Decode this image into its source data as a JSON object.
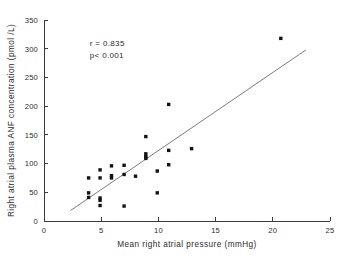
{
  "chart_data": {
    "type": "scatter",
    "title": "",
    "xlabel": "Mean right atrial pressure (mmHg)",
    "ylabel": "Right atrial plasma  ANF concentration  (pmol /L)",
    "xlim": [
      0,
      25
    ],
    "ylim": [
      0,
      350
    ],
    "xticks": [
      0,
      5,
      10,
      15,
      20,
      25
    ],
    "yticks": [
      0,
      50,
      100,
      150,
      200,
      250,
      300,
      350
    ],
    "xtick_labels": [
      "0",
      "5",
      "10",
      "15",
      "20",
      "25"
    ],
    "ytick_labels": [
      "0",
      "50",
      "100",
      "150",
      "200",
      "250",
      "300",
      "350"
    ],
    "grid": false,
    "legend": false,
    "annotations": [
      {
        "text": "r = 0.835",
        "x": 4.0,
        "y": 305
      },
      {
        "text": "p< 0.001",
        "x": 4.0,
        "y": 283
      }
    ],
    "points": [
      {
        "x": 3.9,
        "y": 75
      },
      {
        "x": 3.9,
        "y": 49
      },
      {
        "x": 3.9,
        "y": 41
      },
      {
        "x": 4.9,
        "y": 89
      },
      {
        "x": 4.9,
        "y": 75
      },
      {
        "x": 4.9,
        "y": 40
      },
      {
        "x": 4.9,
        "y": 36
      },
      {
        "x": 4.9,
        "y": 27
      },
      {
        "x": 5.9,
        "y": 96
      },
      {
        "x": 5.9,
        "y": 79
      },
      {
        "x": 5.9,
        "y": 75
      },
      {
        "x": 7.0,
        "y": 97
      },
      {
        "x": 7.0,
        "y": 81
      },
      {
        "x": 7.0,
        "y": 26
      },
      {
        "x": 8.0,
        "y": 78
      },
      {
        "x": 8.9,
        "y": 147
      },
      {
        "x": 8.9,
        "y": 117
      },
      {
        "x": 8.9,
        "y": 112
      },
      {
        "x": 8.9,
        "y": 109
      },
      {
        "x": 9.9,
        "y": 87
      },
      {
        "x": 9.9,
        "y": 49
      },
      {
        "x": 10.9,
        "y": 203
      },
      {
        "x": 10.9,
        "y": 123
      },
      {
        "x": 10.9,
        "y": 98
      },
      {
        "x": 12.9,
        "y": 126
      },
      {
        "x": 20.7,
        "y": 318
      }
    ],
    "fit_line": {
      "x0": 2.3,
      "y0": 18,
      "x1": 22.9,
      "y1": 298
    }
  }
}
